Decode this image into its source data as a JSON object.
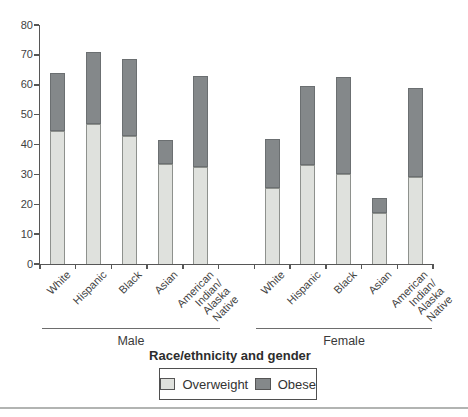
{
  "chart_data": {
    "type": "bar",
    "stacked": true,
    "title": "",
    "xlabel": "Race/ethnicity and gender",
    "ylabel": "",
    "ylim": [
      0,
      80
    ],
    "yticks": [
      0,
      10,
      20,
      30,
      40,
      50,
      60,
      70,
      80
    ],
    "grid": false,
    "legend_position": "bottom-boxed",
    "groups": [
      {
        "label": "Male"
      },
      {
        "label": "Female"
      }
    ],
    "categories": [
      "White",
      "Hispanic",
      "Black",
      "Asian",
      "American\nIndian/\nAlaska\nNative"
    ],
    "series": [
      {
        "name": "Overweight",
        "color": "#dfe1dd",
        "border_color": "#8e918d",
        "values": {
          "Male": [
            44.5,
            47,
            43,
            33.5,
            32.5
          ],
          "Female": [
            25.5,
            33,
            30,
            17,
            29
          ]
        }
      },
      {
        "name": "Obese",
        "color": "#84888a",
        "border_color": "#6b6f71",
        "values": {
          "Male": [
            19.5,
            24,
            25.5,
            8,
            30.5
          ],
          "Female": [
            16.5,
            26.5,
            32.5,
            5,
            30
          ]
        }
      }
    ],
    "totals": {
      "Male": [
        64,
        71,
        68.5,
        41.5,
        63
      ],
      "Female": [
        42,
        59.5,
        62.5,
        22,
        59
      ]
    }
  },
  "colors": {
    "axis": "#565656",
    "text": "#3c3c3c",
    "bottom_rule": "#b2b4b2"
  }
}
